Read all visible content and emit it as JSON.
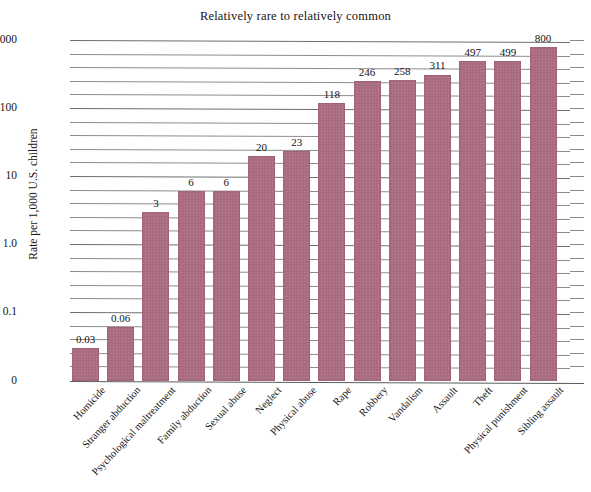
{
  "chart_data": {
    "type": "bar",
    "title": "Relatively rare to relatively common",
    "xlabel": "",
    "ylabel": "Rate per 1,000 U.S. children",
    "scale": "log",
    "grid": true,
    "legend": "none",
    "ylim": [
      0.01,
      1000
    ],
    "ytick_labels": [
      "1000",
      "100",
      "10",
      "1.0",
      "0.1",
      "0"
    ],
    "categories": [
      "Homicide",
      "Stranger abduction",
      "Psychological maltreatment",
      "Family abduction",
      "Sexual abuse",
      "Neglect",
      "Physical abuse",
      "Rape",
      "Robbery",
      "Vandalism",
      "Assault",
      "Theft",
      "Physical punishment",
      "Sibling assault"
    ],
    "values": [
      0.03,
      0.06,
      3,
      6,
      6,
      20,
      23,
      118,
      246,
      258,
      311,
      497,
      499,
      800
    ],
    "value_labels": [
      "0.03",
      "0.06",
      "3",
      "6",
      "6",
      "20",
      "23",
      "118",
      "246",
      "258",
      "311",
      "497",
      "499",
      "800"
    ],
    "bar_color": "#a8697e",
    "grid_color": "#8d8d8d",
    "text_color": "#151515"
  }
}
